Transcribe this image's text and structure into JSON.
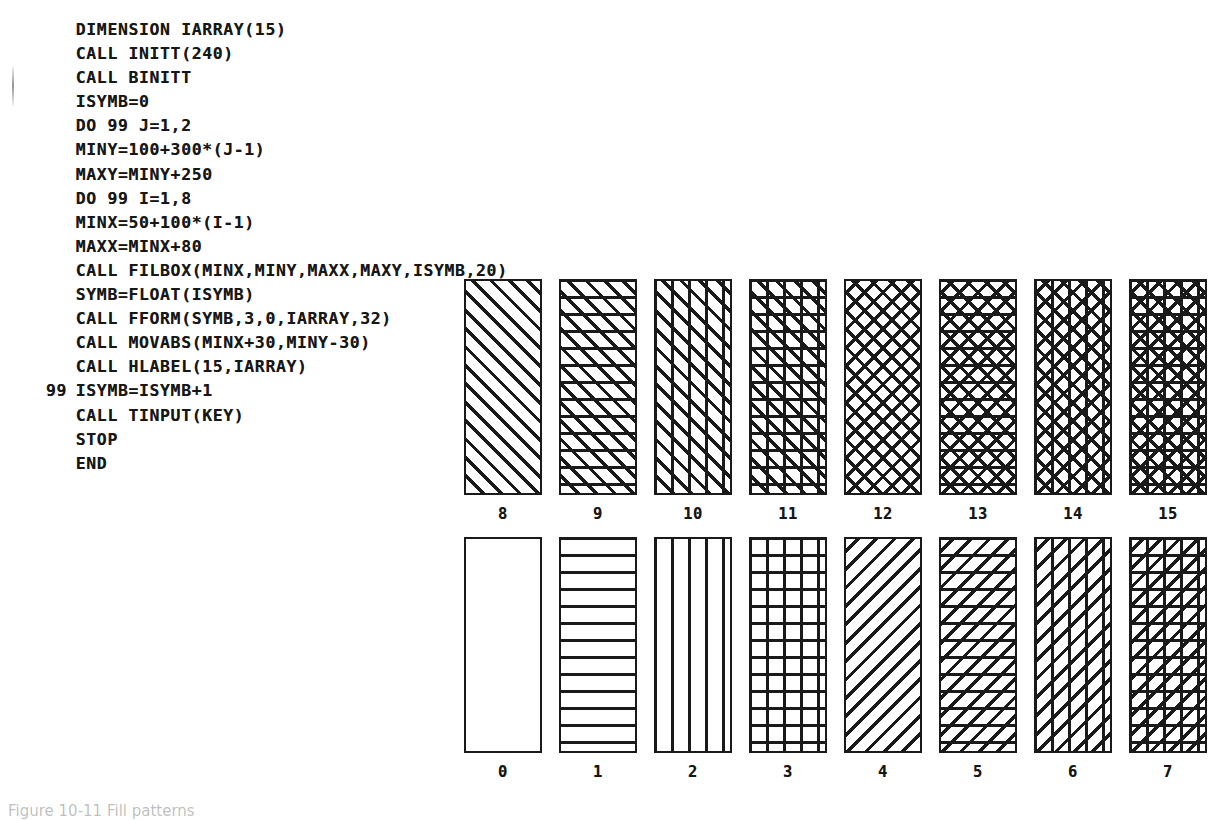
{
  "code_listing": {
    "language": "FORTRAN",
    "lines": [
      {
        "label": "",
        "text": "DIMENSION IARRAY(15)"
      },
      {
        "label": "",
        "text": "CALL INITT(240)"
      },
      {
        "label": "",
        "text": "CALL BINITT"
      },
      {
        "label": "",
        "text": "ISYMB=0"
      },
      {
        "label": "",
        "text": "DO 99 J=1,2"
      },
      {
        "label": "",
        "text": "MINY=100+300*(J-1)"
      },
      {
        "label": "",
        "text": "MAXY=MINY+250"
      },
      {
        "label": "",
        "text": "DO 99 I=1,8"
      },
      {
        "label": "",
        "text": "MINX=50+100*(I-1)"
      },
      {
        "label": "",
        "text": "MAXX=MINX+80"
      },
      {
        "label": "",
        "text": "CALL FILBOX(MINX,MINY,MAXX,MAXY,ISYMB,20)"
      },
      {
        "label": "",
        "text": "SYMB=FLOAT(ISYMB)"
      },
      {
        "label": "",
        "text": "CALL FFORM(SYMB,3,0,IARRAY,32)"
      },
      {
        "label": "",
        "text": "CALL MOVABS(MINX+30,MINY-30)"
      },
      {
        "label": "",
        "text": "CALL HLABEL(15,IARRAY)"
      },
      {
        "label": "99",
        "text": "ISYMB=ISYMB+1"
      },
      {
        "label": "",
        "text": "CALL TINPUT(KEY)"
      },
      {
        "label": "",
        "text": "STOP"
      },
      {
        "label": "",
        "text": "END"
      }
    ]
  },
  "chart_data": {
    "type": "table",
    "box_width_px": 78,
    "box_height_px": 216,
    "rows": [
      {
        "row_name": "upper-row",
        "cells": [
          {
            "label": "8",
            "symbol": 8,
            "pattern": "slash-diagonal",
            "fill_class": "h-slash-f"
          },
          {
            "label": "9",
            "symbol": 9,
            "pattern": "slash-diagonal-horizontal",
            "fill_class": "h-slash-horz"
          },
          {
            "label": "10",
            "symbol": 10,
            "pattern": "slash-diagonal-vertical",
            "fill_class": "h-slash-vert"
          },
          {
            "label": "11",
            "symbol": 11,
            "pattern": "slash-diagonal-grid",
            "fill_class": "h-slash-grid"
          },
          {
            "label": "12",
            "symbol": 12,
            "pattern": "cross-hatch-diagonal",
            "fill_class": "h-cross"
          },
          {
            "label": "13",
            "symbol": 13,
            "pattern": "cross-hatch-horizontal",
            "fill_class": "h-cross-horz"
          },
          {
            "label": "14",
            "symbol": 14,
            "pattern": "cross-hatch-vertical",
            "fill_class": "h-cross-vert"
          },
          {
            "label": "15",
            "symbol": 15,
            "pattern": "cross-hatch-grid",
            "fill_class": "h-cross-grid"
          }
        ]
      },
      {
        "row_name": "lower-row",
        "cells": [
          {
            "label": "0",
            "symbol": 0,
            "pattern": "empty",
            "fill_class": "h-none"
          },
          {
            "label": "1",
            "symbol": 1,
            "pattern": "horizontal-lines",
            "fill_class": "h-horz"
          },
          {
            "label": "2",
            "symbol": 2,
            "pattern": "vertical-lines",
            "fill_class": "h-vert"
          },
          {
            "label": "3",
            "symbol": 3,
            "pattern": "grid",
            "fill_class": "h-grid"
          },
          {
            "label": "4",
            "symbol": 4,
            "pattern": "back-diagonal",
            "fill_class": "h-back-f"
          },
          {
            "label": "5",
            "symbol": 5,
            "pattern": "back-diagonal-horizontal",
            "fill_class": "h-back-horz"
          },
          {
            "label": "6",
            "symbol": 6,
            "pattern": "back-diagonal-vertical",
            "fill_class": "h-back-vert"
          },
          {
            "label": "7",
            "symbol": 7,
            "pattern": "back-diagonal-grid",
            "fill_class": "h-back-grid"
          }
        ]
      }
    ]
  },
  "caption": {
    "text": "Figure 10-11  Fill patterns"
  }
}
